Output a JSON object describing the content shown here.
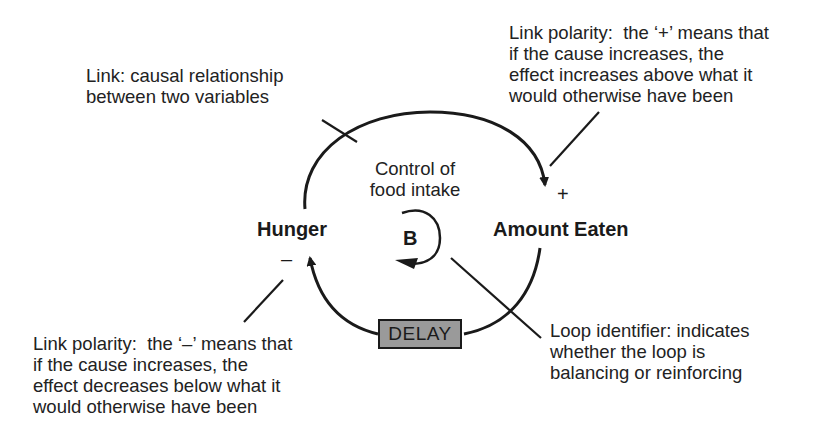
{
  "diagram": {
    "type": "causal-loop-diagram",
    "variables": [
      {
        "id": "hunger",
        "label": "Hunger"
      },
      {
        "id": "amount_eaten",
        "label": "Amount Eaten"
      }
    ],
    "links": [
      {
        "from": "hunger",
        "to": "amount_eaten",
        "polarity": "+",
        "delay": false
      },
      {
        "from": "amount_eaten",
        "to": "hunger",
        "polarity": "–",
        "delay": true
      }
    ],
    "loop": {
      "name": "Control of\nfood intake",
      "identifier": "B"
    },
    "delay_label": "DELAY",
    "signs": {
      "plus": "+",
      "minus": "–"
    },
    "annotations": {
      "link": "Link: causal relationship\nbetween two variables",
      "positive_polarity": "Link polarity:  the ‘+’ means that\nif the cause increases, the\neffect increases above what it\nwould otherwise have been",
      "negative_polarity": "Link polarity:  the ‘–’ means that\nif the cause increases, the\neffect decreases below what it\nwould otherwise have been",
      "loop_identifier": "Loop identifier: indicates\nwhether the loop is\nbalancing or reinforcing"
    },
    "colors": {
      "ink": "#1a1a1a",
      "delay_fill": "#9a9a9a",
      "background": "#ffffff"
    }
  }
}
